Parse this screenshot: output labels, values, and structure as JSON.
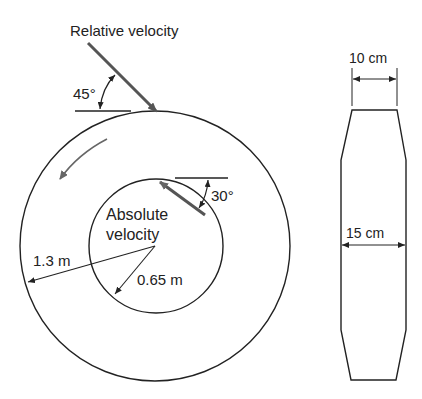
{
  "diagram": {
    "title_label": "Relative velocity",
    "relative_angle": "45°",
    "absolute_angle": "30°",
    "absolute_label_line1": "Absolute",
    "absolute_label_line2": "velocity",
    "outer_radius_label": "1.3 m",
    "inner_radius_label": "0.65 m",
    "side_view": {
      "top_width_label": "10 cm",
      "middle_width_label": "15 cm"
    },
    "colors": {
      "line": "#222222",
      "vector": "#555555"
    }
  }
}
